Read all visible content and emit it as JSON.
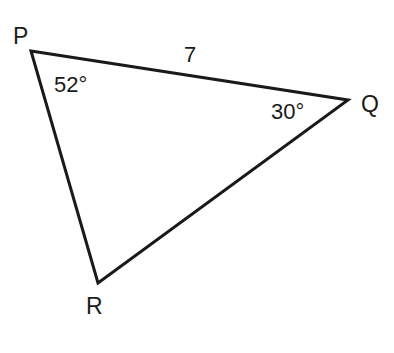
{
  "figure": {
    "kind": "triangle-diagram",
    "background_color": "#ffffff",
    "stroke_color": "#1a1a1a",
    "text_color": "#1a1a1a",
    "stroke_width": 3,
    "canvas": {
      "width": 394,
      "height": 353
    }
  },
  "vertices": [
    {
      "id": "P",
      "label": "P",
      "x": 31,
      "y": 51,
      "label_x": 13,
      "label_y": 25
    },
    {
      "id": "Q",
      "label": "Q",
      "x": 348,
      "y": 100,
      "label_x": 361,
      "label_y": 93
    },
    {
      "id": "R",
      "label": "R",
      "x": 98,
      "y": 283,
      "label_x": 86,
      "label_y": 295
    }
  ],
  "sides": [
    {
      "id": "PQ",
      "from": "P",
      "to": "Q",
      "label": "7",
      "label_x": 184,
      "label_y": 44
    },
    {
      "id": "QR",
      "from": "Q",
      "to": "R",
      "label": ""
    },
    {
      "id": "RP",
      "from": "R",
      "to": "P",
      "label": ""
    }
  ],
  "angles": [
    {
      "at": "P",
      "label": "52°",
      "value": 52,
      "unit": "degrees",
      "label_x": 54,
      "label_y": 74
    },
    {
      "at": "Q",
      "label": "30°",
      "value": 30,
      "unit": "degrees",
      "label_x": 271,
      "label_y": 101
    }
  ],
  "chart_data": {
    "type": "diagram",
    "title": "",
    "shape": "triangle",
    "vertex_names": [
      "P",
      "Q",
      "R"
    ],
    "vertex_points": [
      [
        31,
        51
      ],
      [
        348,
        100
      ],
      [
        98,
        283
      ]
    ],
    "labeled_angles": {
      "P": 52,
      "Q": 30
    },
    "labeled_sides": {
      "PQ": 7
    },
    "angle_unit": "degrees"
  }
}
